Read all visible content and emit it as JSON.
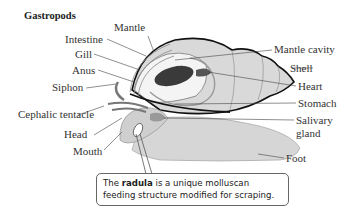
{
  "title": "Gastropods",
  "labels_left": [
    {
      "id": "mantle",
      "text": "Mantle"
    },
    {
      "id": "intestine",
      "text": "Intestine"
    },
    {
      "id": "gill",
      "text": "Gill"
    },
    {
      "id": "anus",
      "text": "Anus"
    },
    {
      "id": "siphon",
      "text": "Siphon"
    },
    {
      "id": "cephalic-tentacle",
      "text": "Cephalic tentacle"
    },
    {
      "id": "head",
      "text": "Head"
    },
    {
      "id": "mouth",
      "text": "Mouth"
    }
  ],
  "labels_right": [
    {
      "id": "mantle-cavity",
      "text": "Mantle cavity"
    },
    {
      "id": "shell",
      "text": "Shell"
    },
    {
      "id": "heart",
      "text": "Heart"
    },
    {
      "id": "stomach",
      "text": "Stomach"
    },
    {
      "id": "salivary-gland-1",
      "text": "Salivary"
    },
    {
      "id": "salivary-gland-2",
      "text": "gland"
    },
    {
      "id": "foot",
      "text": "Foot"
    }
  ],
  "callout": {
    "prefix": "The ",
    "bold": "radula",
    "suffix": " is a unique molluscan",
    "line2": "feeding structure modified for scraping."
  },
  "colors": {
    "body_fill": "#d4d4d4",
    "shell_fill": "#d9d9d9",
    "gill_fill": "#3a3a3a",
    "outline": "#111111",
    "leader": "#444444"
  }
}
